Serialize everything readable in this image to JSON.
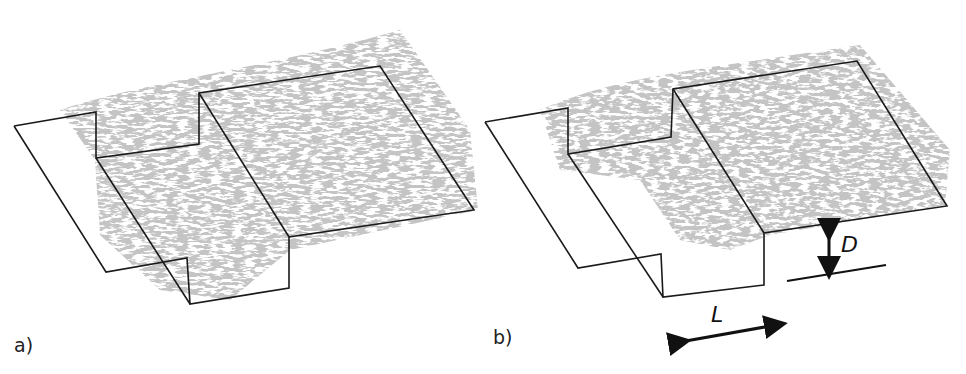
{
  "figure": {
    "panels": [
      {
        "id": "a",
        "label": "a)"
      },
      {
        "id": "b",
        "label": "b)"
      }
    ],
    "annotations": {
      "depth_symbol": "D",
      "length_symbol": "L"
    },
    "colors": {
      "structures": "#9a9a9a",
      "structures_dark": "#6e6e6e",
      "outline": "#1a1a1a",
      "background": "#ffffff"
    }
  }
}
